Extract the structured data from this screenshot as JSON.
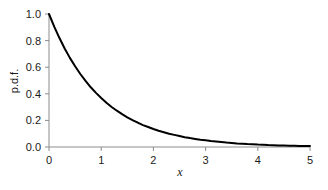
{
  "chart_data": {
    "type": "line",
    "title": "",
    "subtitle": "",
    "xlabel": "x",
    "ylabel": "p.d.f.",
    "xlim": [
      0,
      5
    ],
    "ylim": [
      0,
      1.0
    ],
    "grid": false,
    "legend": null,
    "legend_position": "none",
    "annotations": [],
    "xticks": [
      0,
      1,
      2,
      3,
      4,
      5
    ],
    "xtick_labels": [
      "0",
      "1",
      "2",
      "3",
      "4",
      "5"
    ],
    "yticks": [
      0.0,
      0.2,
      0.4,
      0.6,
      0.8,
      1.0
    ],
    "ytick_labels": [
      "0.0",
      "0.2",
      "0.4",
      "0.6",
      "0.8",
      "1.0"
    ],
    "series": [
      {
        "name": "exponential pdf",
        "color": "#000000",
        "x": [
          0.0,
          0.1,
          0.2,
          0.3,
          0.4,
          0.5,
          0.6,
          0.7,
          0.8,
          0.9,
          1.0,
          1.1,
          1.2,
          1.3,
          1.4,
          1.5,
          1.6,
          1.7,
          1.8,
          1.9,
          2.0,
          2.1,
          2.2,
          2.3,
          2.4,
          2.5,
          2.6,
          2.7,
          2.8,
          2.9,
          3.0,
          3.1,
          3.2,
          3.3,
          3.4,
          3.5,
          3.6,
          3.7,
          3.8,
          3.9,
          4.0,
          4.1,
          4.2,
          4.3,
          4.4,
          4.5,
          4.6,
          4.7,
          4.8,
          4.9,
          5.0
        ],
        "values": [
          1.0,
          0.905,
          0.819,
          0.741,
          0.67,
          0.607,
          0.549,
          0.497,
          0.449,
          0.407,
          0.368,
          0.333,
          0.301,
          0.273,
          0.247,
          0.223,
          0.202,
          0.183,
          0.165,
          0.15,
          0.135,
          0.122,
          0.111,
          0.1,
          0.091,
          0.082,
          0.074,
          0.067,
          0.061,
          0.055,
          0.05,
          0.045,
          0.041,
          0.037,
          0.033,
          0.03,
          0.027,
          0.025,
          0.022,
          0.02,
          0.018,
          0.017,
          0.015,
          0.014,
          0.012,
          0.011,
          0.01,
          0.009,
          0.008,
          0.007,
          0.007
        ]
      }
    ]
  },
  "style": {
    "axis_color": "#8c8c8c",
    "curve_color": "#000000",
    "text_color": "#1a1a1a",
    "background": "#ffffff"
  }
}
